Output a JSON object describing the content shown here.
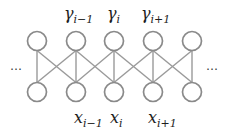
{
  "diagram": {
    "type": "chain-graph",
    "colors": {
      "node_stroke": "#8a8a8a",
      "edge": "#9a9a9a",
      "text": "#1e1e1e",
      "background": "#ffffff"
    },
    "ellipsis_left": "…",
    "ellipsis_right": "…",
    "top_labels": [
      {
        "symbol": "γ",
        "subscript": "i−1"
      },
      {
        "symbol": "γ",
        "subscript": "i"
      },
      {
        "symbol": "γ",
        "subscript": "i+1"
      }
    ],
    "bottom_labels": [
      {
        "symbol": "x",
        "subscript": "i−1"
      },
      {
        "symbol": "x",
        "subscript": "i"
      },
      {
        "symbol": "x",
        "subscript": "i+1"
      }
    ],
    "node_columns": 5,
    "node_rows": [
      "top",
      "bottom"
    ]
  }
}
